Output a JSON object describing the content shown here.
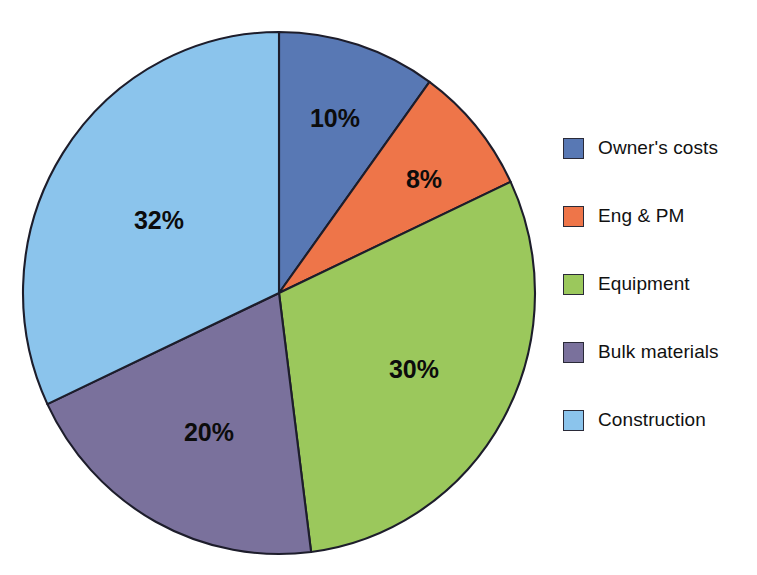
{
  "page": {
    "background_color": "#ffffff",
    "top_clipped_text": "",
    "outline_color": "#1d1d2b"
  },
  "chart_data": {
    "type": "pie",
    "title": "",
    "subtitle": "",
    "xlabel": "",
    "ylabel": "",
    "legend_position": "right",
    "grid": false,
    "start_angle_deg": 0,
    "direction": "clockwise",
    "units": "percent",
    "total": 100,
    "categories": [
      "Owner's costs",
      "Eng & PM",
      "Equipment",
      "Bulk materials",
      "Construction"
    ],
    "values": [
      10,
      8,
      30,
      20,
      32
    ],
    "data_labels": [
      "10%",
      "8%",
      "30%",
      "20%",
      "32%"
    ],
    "colors": [
      "#5878b4",
      "#ee7549",
      "#9bc85c",
      "#7a719c",
      "#8bc4ec"
    ],
    "slices": [
      {
        "label": "Owner's costs",
        "value": 10,
        "data_label": "10%",
        "color": "#5878b4",
        "start_deg": 0,
        "end_deg": 36,
        "label_x": 335,
        "label_y": 120
      },
      {
        "label": "Eng & PM",
        "value": 8,
        "data_label": "8%",
        "color": "#ee7549",
        "start_deg": 36,
        "end_deg": 64.8,
        "label_x": 424,
        "label_y": 181
      },
      {
        "label": "Equipment",
        "value": 30,
        "data_label": "30%",
        "color": "#9bc85c",
        "start_deg": 64.8,
        "end_deg": 172.8,
        "label_x": 414,
        "label_y": 371
      },
      {
        "label": "Bulk materials",
        "value": 20,
        "data_label": "20%",
        "color": "#7a719c",
        "start_deg": 172.8,
        "end_deg": 244.8,
        "label_x": 209,
        "label_y": 434
      },
      {
        "label": "Construction",
        "value": 32,
        "data_label": "32%",
        "color": "#8bc4ec",
        "start_deg": 244.8,
        "end_deg": 360,
        "label_x": 159,
        "label_y": 222
      }
    ],
    "geometry": {
      "center_x": 279,
      "center_y": 293,
      "radius_x": 256,
      "radius_y": 261
    }
  },
  "legend": {
    "items": [
      {
        "label": "Owner's costs",
        "color": "#5878b4"
      },
      {
        "label": "Eng & PM",
        "color": "#ee7549"
      },
      {
        "label": "Equipment",
        "color": "#9bc85c"
      },
      {
        "label": "Bulk materials",
        "color": "#7a719c"
      },
      {
        "label": "Construction",
        "color": "#8bc4ec"
      }
    ]
  }
}
